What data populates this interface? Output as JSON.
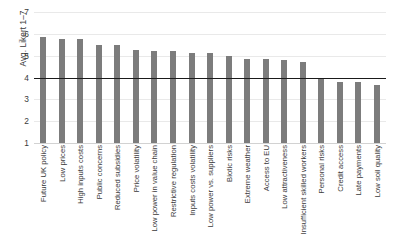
{
  "chart_data": {
    "type": "bar",
    "title": "",
    "xlabel": "",
    "ylabel": "Avg. Likert 1–7",
    "ylim": [
      1,
      7
    ],
    "yticks": [
      1,
      2,
      3,
      4,
      5,
      6,
      7
    ],
    "grid": true,
    "legend": "none",
    "orientation": "vertical",
    "bar_color": "#7c7c7c",
    "reference_line": {
      "value": 4,
      "color": "#1a1a1a",
      "orientation": "horizontal"
    },
    "categories": [
      "Future UK policy",
      "Low prices",
      "High inputs costs",
      "Public concerns",
      "Reduced subsidies",
      "Price volatility",
      "Low power in value chain",
      "Restrictive regulation",
      "Inputs costs volatility",
      "Low power vs. suppliers",
      "Biotic risks",
      "Extreme weather",
      "Access to EU",
      "Low attractiveness",
      "Insufficient skilled workers",
      "Personal risks",
      "Credit access",
      "Late payments",
      "Low soil quality"
    ],
    "values": [
      5.85,
      5.75,
      5.75,
      5.5,
      5.5,
      5.25,
      5.2,
      5.2,
      5.1,
      5.1,
      5.0,
      4.85,
      4.85,
      4.8,
      4.7,
      3.95,
      3.8,
      3.8,
      3.65
    ]
  }
}
